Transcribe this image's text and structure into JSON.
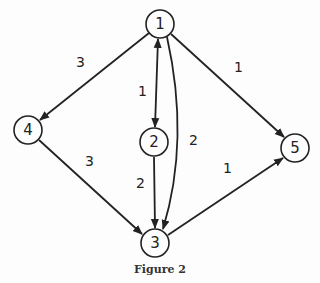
{
  "caption": "Figure 2",
  "nodes": [
    {
      "id": "1",
      "label": "1",
      "x": 160,
      "y": 24
    },
    {
      "id": "2",
      "label": "2",
      "x": 154,
      "y": 142
    },
    {
      "id": "3",
      "label": "3",
      "x": 155,
      "y": 243
    },
    {
      "id": "4",
      "label": "4",
      "x": 28,
      "y": 130
    },
    {
      "id": "5",
      "label": "5",
      "x": 295,
      "y": 148
    }
  ],
  "edges": [
    {
      "from": "1",
      "to": "4",
      "weight": "3",
      "directed": true
    },
    {
      "from": "1",
      "to": "2",
      "weight": "1",
      "directed": true,
      "bidirectional": true
    },
    {
      "from": "1",
      "to": "3",
      "weight": "2",
      "directed": true,
      "curved": true
    },
    {
      "from": "1",
      "to": "5",
      "weight": "1",
      "directed": true
    },
    {
      "from": "4",
      "to": "3",
      "weight": "3",
      "directed": true
    },
    {
      "from": "2",
      "to": "3",
      "weight": "2",
      "directed": true
    },
    {
      "from": "3",
      "to": "5",
      "weight": "1",
      "directed": true
    }
  ]
}
